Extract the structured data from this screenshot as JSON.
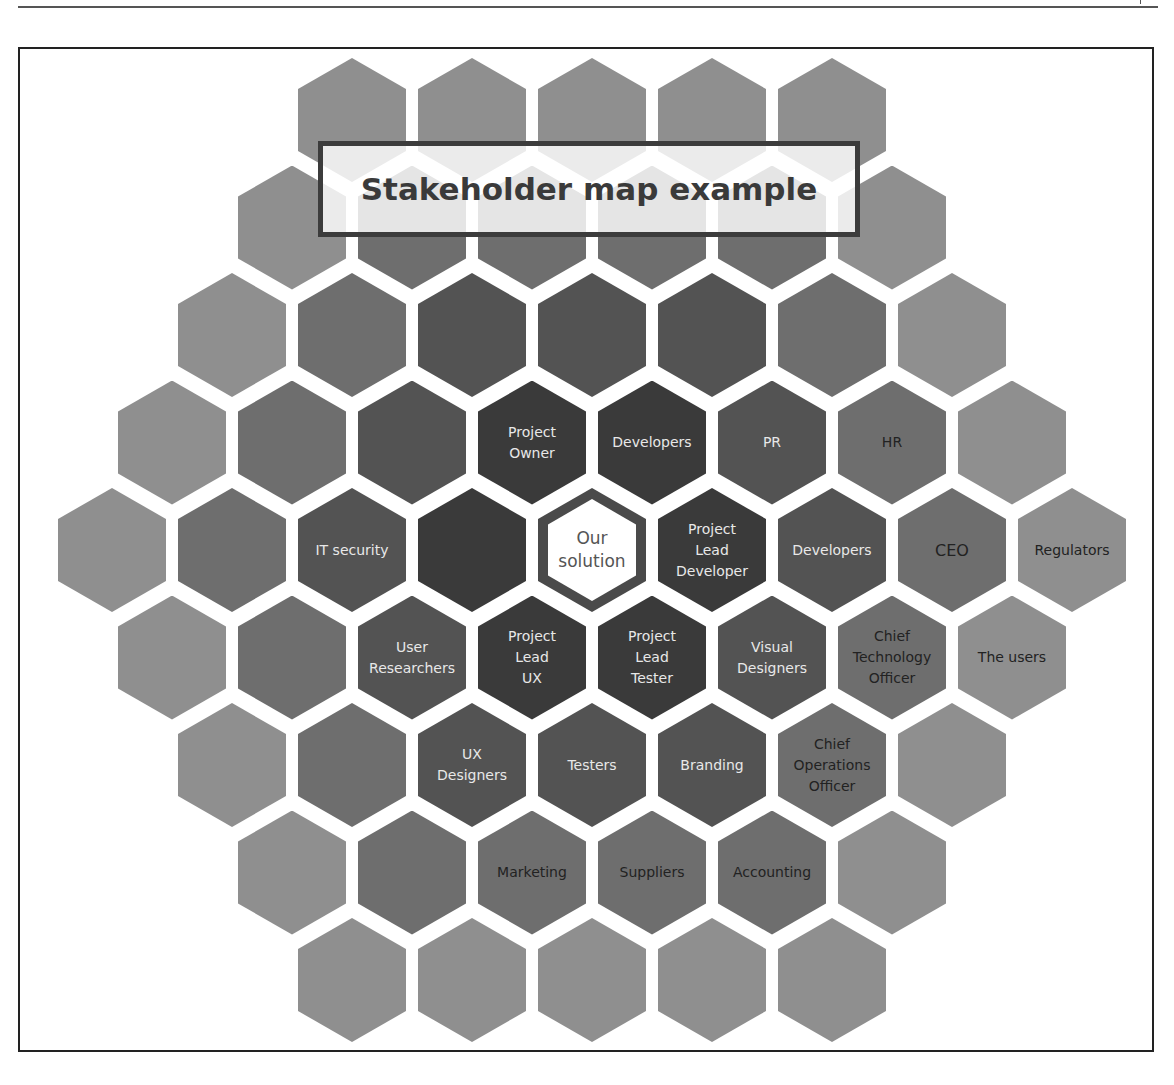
{
  "title": "Stakeholder map example",
  "colors": {
    "ring0": "#ffffff",
    "ring1": "#3a3a3a",
    "ring2": "#535353",
    "ring3": "#6e6e6e",
    "ring4": "#8f8f8f",
    "ring5": "#b0b0b0",
    "center_border": "#4a4a4a",
    "light_text": "#e8e8e8",
    "dark_text": "#222222"
  },
  "center": {
    "label": "Our\nsolution"
  },
  "stakeholders": [
    {
      "row": 3,
      "col": 3,
      "label": "Project\nOwner"
    },
    {
      "row": 3,
      "col": 4,
      "label": "Developers"
    },
    {
      "row": 3,
      "col": 5,
      "label": "PR"
    },
    {
      "row": 3,
      "col": 6,
      "label": "HR"
    },
    {
      "row": 4,
      "col": 2,
      "label": "IT security"
    },
    {
      "row": 4,
      "col": 5,
      "label": "Project\nLead\nDeveloper"
    },
    {
      "row": 4,
      "col": 6,
      "label": "Developers"
    },
    {
      "row": 4,
      "col": 7,
      "label": "CEO"
    },
    {
      "row": 4,
      "col": 8,
      "label": "Regulators"
    },
    {
      "row": 5,
      "col": 2,
      "label": "User\nResearchers"
    },
    {
      "row": 5,
      "col": 3,
      "label": "Project\nLead\nUX"
    },
    {
      "row": 5,
      "col": 4,
      "label": "Project\nLead\nTester"
    },
    {
      "row": 5,
      "col": 5,
      "label": "Visual\nDesigners"
    },
    {
      "row": 5,
      "col": 6,
      "label": "Chief\nTechnology\nOfficer"
    },
    {
      "row": 5,
      "col": 7,
      "label": "The users"
    },
    {
      "row": 6,
      "col": 2,
      "label": "UX\nDesigners"
    },
    {
      "row": 6,
      "col": 3,
      "label": "Testers"
    },
    {
      "row": 6,
      "col": 4,
      "label": "Branding"
    },
    {
      "row": 6,
      "col": 5,
      "label": "Chief\nOperations\nOfficer"
    },
    {
      "row": 7,
      "col": 2,
      "label": "Marketing"
    },
    {
      "row": 7,
      "col": 3,
      "label": "Suppliers"
    },
    {
      "row": 7,
      "col": 4,
      "label": "Accounting"
    }
  ],
  "grid": {
    "rows": [
      5,
      6,
      7,
      8,
      9,
      8,
      7,
      6,
      5
    ],
    "center_row": 4,
    "center_col": 4
  }
}
